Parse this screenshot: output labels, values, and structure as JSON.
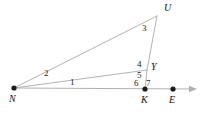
{
  "figure": {
    "background_color": "#ffffff",
    "line_color": "#b3b3b3",
    "point_color": "#1a1a1a",
    "label_color": "#111111"
  },
  "points": [
    {
      "name": "N",
      "label": "N",
      "x": 14,
      "y": 88,
      "dot": true,
      "label_x": 9,
      "label_y": 94
    },
    {
      "name": "K",
      "label": "K",
      "x": 145,
      "y": 89,
      "dot": true,
      "label_x": 141,
      "label_y": 95
    },
    {
      "name": "E",
      "label": "E",
      "x": 173,
      "y": 89,
      "dot": true,
      "label_x": 169,
      "label_y": 95
    },
    {
      "name": "U",
      "label": "U",
      "x": 157,
      "y": 16,
      "dot": false,
      "label_x": 164,
      "label_y": 3
    },
    {
      "name": "Y",
      "label": "Y",
      "x": 147,
      "y": 70,
      "dot": false,
      "label_x": 151,
      "label_y": 62
    }
  ],
  "segments": [
    {
      "name": "ray-N-to-E",
      "from": "N",
      "to": "arrow-tip",
      "x1": 14,
      "y1": 88,
      "x2": 193,
      "y2": 89
    },
    {
      "name": "segment-N-to-U",
      "from": "N",
      "to": "U",
      "x1": 14,
      "y1": 88,
      "x2": 157,
      "y2": 16
    },
    {
      "name": "segment-N-to-Y",
      "from": "N",
      "to": "Y",
      "x1": 14,
      "y1": 88,
      "x2": 147,
      "y2": 70
    },
    {
      "name": "segment-U-to-Y",
      "from": "U",
      "to": "Y",
      "x1": 157,
      "y1": 16,
      "x2": 147,
      "y2": 70
    },
    {
      "name": "segment-Y-to-K",
      "from": "Y",
      "to": "K",
      "x1": 147,
      "y1": 70,
      "x2": 145,
      "y2": 89
    }
  ],
  "arrow": {
    "name": "ray-arrowhead",
    "tip_x": 197,
    "tip_y": 89,
    "back_x": 189,
    "half_height": 3.2
  },
  "angles": [
    {
      "id": "1",
      "label": "1",
      "at_vertex": "N",
      "x": 70,
      "y": 78
    },
    {
      "id": "2",
      "label": "2",
      "at_vertex": "N",
      "x": 44,
      "y": 69
    },
    {
      "id": "3",
      "label": "3",
      "at_vertex": "U",
      "x": 142,
      "y": 24
    },
    {
      "id": "4",
      "label": "4",
      "at_vertex": "Y",
      "x": 137,
      "y": 60
    },
    {
      "id": "5",
      "label": "5",
      "at_vertex": "Y",
      "x": 137,
      "y": 71
    },
    {
      "id": "6",
      "label": "6",
      "at_vertex": "K",
      "x": 134,
      "y": 79
    },
    {
      "id": "7",
      "label": "7",
      "at_vertex": "K",
      "x": 146,
      "y": 79
    }
  ]
}
